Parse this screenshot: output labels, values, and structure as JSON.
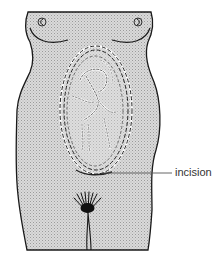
{
  "figure": {
    "labels": [
      {
        "id": "incision",
        "text": "incision"
      }
    ],
    "colors": {
      "outline": "#1a1a1a",
      "body_fill": "#cfcfcf",
      "background": "#ffffff",
      "label_text": "#333333",
      "leader_line": "#555555"
    }
  }
}
